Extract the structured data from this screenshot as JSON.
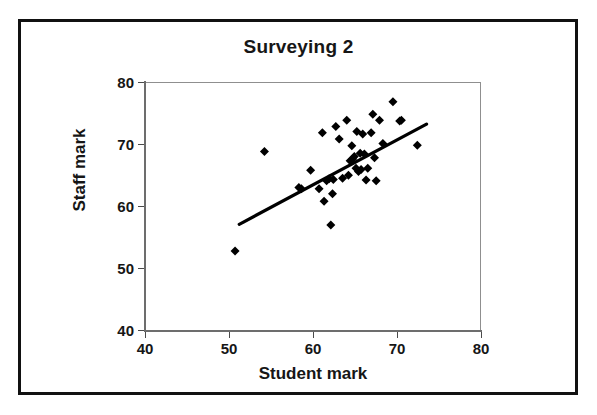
{
  "figure": {
    "title": "Surveying 2",
    "frame_color": "#111111",
    "background_color": "#ffffff"
  },
  "axes": {
    "x_title": "Student mark",
    "y_title": "Staff mark",
    "x_ticks": [
      "40",
      "50",
      "60",
      "70",
      "80"
    ],
    "y_ticks": [
      "40",
      "50",
      "60",
      "70",
      "80"
    ]
  },
  "chart_data": {
    "type": "scatter",
    "title": "Surveying 2",
    "xlabel": "Student mark",
    "ylabel": "Staff mark",
    "xlim": [
      40,
      80
    ],
    "ylim": [
      40,
      80
    ],
    "xticks": [
      40,
      50,
      60,
      70,
      80
    ],
    "yticks": [
      40,
      50,
      60,
      70,
      80
    ],
    "grid": false,
    "legend": null,
    "marker": "diamond",
    "marker_color": "#000000",
    "marker_size": 9,
    "series": [
      {
        "name": "Student vs Staff mark",
        "points": [
          [
            50.6,
            53.0
          ],
          [
            54.1,
            69.0
          ],
          [
            58.2,
            63.2
          ],
          [
            58.5,
            63.0
          ],
          [
            59.6,
            66.0
          ],
          [
            60.6,
            63.0
          ],
          [
            61.0,
            72.0
          ],
          [
            61.2,
            61.0
          ],
          [
            61.5,
            64.3
          ],
          [
            61.8,
            64.6
          ],
          [
            62.0,
            57.2
          ],
          [
            62.2,
            62.2
          ],
          [
            62.3,
            64.5
          ],
          [
            62.6,
            73.0
          ],
          [
            63.0,
            71.0
          ],
          [
            63.4,
            64.7
          ],
          [
            63.9,
            74.0
          ],
          [
            64.1,
            65.2
          ],
          [
            64.3,
            67.5
          ],
          [
            64.5,
            69.9
          ],
          [
            64.6,
            67.8
          ],
          [
            64.8,
            68.2
          ],
          [
            65.0,
            66.3
          ],
          [
            65.1,
            72.2
          ],
          [
            65.3,
            65.8
          ],
          [
            65.5,
            68.7
          ],
          [
            65.6,
            66.1
          ],
          [
            65.8,
            71.8
          ],
          [
            66.0,
            68.6
          ],
          [
            66.2,
            64.4
          ],
          [
            66.4,
            66.3
          ],
          [
            66.8,
            72.0
          ],
          [
            67.0,
            75.0
          ],
          [
            67.2,
            68.0
          ],
          [
            67.4,
            64.3
          ],
          [
            67.8,
            74.0
          ],
          [
            68.2,
            70.3
          ],
          [
            69.4,
            77.0
          ],
          [
            70.2,
            73.9
          ],
          [
            70.4,
            74.0
          ],
          [
            72.3,
            70.0
          ]
        ]
      }
    ],
    "trendline": {
      "type": "linear",
      "x_start": 51.1,
      "y_start": 57.3,
      "x_end": 73.4,
      "y_end": 73.4,
      "color": "#000000",
      "width": 3.2
    }
  }
}
